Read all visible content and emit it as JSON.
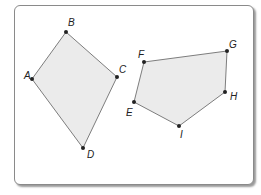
{
  "figure": {
    "colors": {
      "fill": "#ebebeb",
      "stroke": "#7d7d7d",
      "point": "#222222",
      "frame": "#8a8a8a"
    },
    "polygons": [
      {
        "name": "ABCD",
        "vertices": [
          {
            "label": "A",
            "x": 32,
            "y": 79,
            "lx": 24,
            "ly": 79
          },
          {
            "label": "B",
            "x": 66,
            "y": 32,
            "lx": 68,
            "ly": 26
          },
          {
            "label": "C",
            "x": 117,
            "y": 77,
            "lx": 119,
            "ly": 73
          },
          {
            "label": "D",
            "x": 83,
            "y": 148,
            "lx": 87,
            "ly": 158
          }
        ]
      },
      {
        "name": "EFGHI",
        "vertices": [
          {
            "label": "E",
            "x": 134,
            "y": 102,
            "lx": 126,
            "ly": 116
          },
          {
            "label": "F",
            "x": 144,
            "y": 62,
            "lx": 138,
            "ly": 58
          },
          {
            "label": "G",
            "x": 227,
            "y": 51,
            "lx": 229,
            "ly": 48
          },
          {
            "label": "H",
            "x": 225,
            "y": 92,
            "lx": 230,
            "ly": 100
          },
          {
            "label": "I",
            "x": 179,
            "y": 126,
            "lx": 180,
            "ly": 138
          }
        ]
      }
    ]
  }
}
